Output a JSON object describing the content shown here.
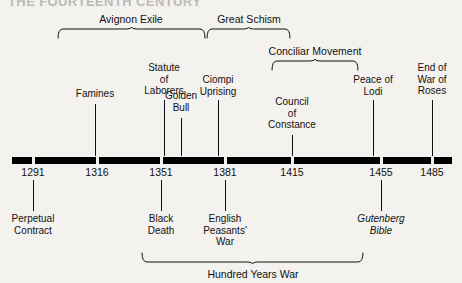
{
  "figure": {
    "title": "THE FOURTEENTH CENTURY"
  },
  "axis": {
    "dates": [
      {
        "label": "1291",
        "x": 33
      },
      {
        "label": "1316",
        "x": 97
      },
      {
        "label": "1351",
        "x": 161
      },
      {
        "label": "1381",
        "x": 225
      },
      {
        "label": "1415",
        "x": 292
      },
      {
        "label": "1455",
        "x": 381
      },
      {
        "label": "1485",
        "x": 432
      }
    ]
  },
  "events_above": [
    {
      "label": "Famines",
      "x": 95,
      "top": 88,
      "tick_top": 104,
      "tick_height": 52
    },
    {
      "label": "Statute\nof\nLaborers",
      "x": 164,
      "top": 62,
      "tick_top": 100,
      "tick_height": 56
    },
    {
      "label": "Golden\nBull",
      "x": 181,
      "top": 90,
      "tick_top": 118,
      "tick_height": 38
    },
    {
      "label": "Ciompi\nUprising",
      "x": 218,
      "top": 74,
      "tick_top": 100,
      "tick_height": 56
    },
    {
      "label": "Council\nof\nConstance",
      "x": 292,
      "top": 96,
      "tick_top": 135,
      "tick_height": 21
    },
    {
      "label": "Peace of\nLodi",
      "x": 373,
      "top": 74,
      "tick_top": 100,
      "tick_height": 56
    },
    {
      "label": "End of\nWar of\nRoses",
      "x": 432,
      "top": 62,
      "tick_top": 100,
      "tick_height": 56
    }
  ],
  "events_below": [
    {
      "label": "Perpetual\nContract",
      "x": 33,
      "top": 213,
      "tick_top": 180,
      "tick_height": 31,
      "italic": false
    },
    {
      "label": "Black\nDeath",
      "x": 161,
      "top": 213,
      "tick_top": 180,
      "tick_height": 31,
      "italic": false
    },
    {
      "label": "English\nPeasants'\nWar",
      "x": 225,
      "top": 213,
      "tick_top": 180,
      "tick_height": 31,
      "italic": false
    },
    {
      "label": "Gutenberg\nBible",
      "x": 381,
      "top": 213,
      "tick_top": 180,
      "tick_height": 31,
      "italic": true
    }
  ],
  "spans_above": [
    {
      "label": "Avignon Exile",
      "x1": 58,
      "x2": 205,
      "label_x": 131,
      "label_top": 13,
      "brace_top": 26
    },
    {
      "label": "Great Schism",
      "x1": 207,
      "x2": 290,
      "label_x": 249,
      "label_top": 13,
      "brace_top": 26
    },
    {
      "label": "Conciliar Movement",
      "x1": 272,
      "x2": 358,
      "label_x": 315,
      "label_top": 45,
      "brace_top": 58
    }
  ],
  "spans_below": [
    {
      "label": "Hundred Years War",
      "x1": 142,
      "x2": 363,
      "label_x": 253,
      "label_top": 268,
      "brace_top": 253
    }
  ]
}
